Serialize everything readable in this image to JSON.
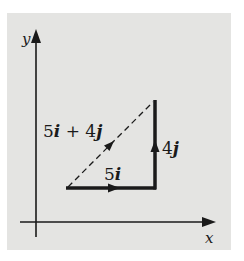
{
  "diagram": {
    "axes": {
      "x_label": "x",
      "y_label": "y"
    },
    "vectors": [
      {
        "name": "5i",
        "label_num": "5",
        "label_unit": "i",
        "style": "solid"
      },
      {
        "name": "4j",
        "label_num": "4",
        "label_unit": "j",
        "style": "solid"
      },
      {
        "name": "5i + 4j",
        "label_a": "5",
        "label_a_unit": "i",
        "label_op": " + ",
        "label_b": "4",
        "label_b_unit": "j",
        "style": "dashed"
      }
    ],
    "colors": {
      "background": "#e4e4e2",
      "ink": "#1a1a1a"
    }
  }
}
